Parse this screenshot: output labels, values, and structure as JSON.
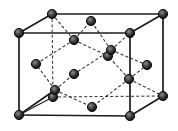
{
  "diagram": {
    "kind": "crystal-structure-unit-cell",
    "canvas": {
      "width": 178,
      "height": 131,
      "background": "#ffffff"
    },
    "style": {
      "edge_color": "#1c1c1c",
      "edge_width": 1.7,
      "hidden_edge_color": "#2e2e2e",
      "hidden_edge_width": 1.0,
      "bond_color": "#2e2e2e",
      "bond_width": 1.05,
      "dash_pattern": "3 2.2",
      "solid_bond_width": 1.6,
      "thin_edge_width": 1.1,
      "atom_radius": 4.6,
      "atom_stroke": "#000000",
      "atom_stroke_width": 0.9,
      "atom_core_color": "#8c8c8c",
      "atom_mid_color": "#343434",
      "atom_rim_color": "#0a0a0a"
    },
    "atoms": [
      {
        "id": "FTL",
        "x": 19,
        "y": 33,
        "kind": "corner"
      },
      {
        "id": "FTR",
        "x": 130,
        "y": 33,
        "kind": "corner"
      },
      {
        "id": "FBL",
        "x": 19,
        "y": 115,
        "kind": "corner"
      },
      {
        "id": "FBR",
        "x": 130,
        "y": 116,
        "kind": "corner"
      },
      {
        "id": "BTL",
        "x": 52,
        "y": 14,
        "kind": "corner"
      },
      {
        "id": "BTR",
        "x": 163,
        "y": 14,
        "kind": "corner"
      },
      {
        "id": "BBL",
        "x": 53,
        "y": 97,
        "kind": "corner"
      },
      {
        "id": "BBR",
        "x": 163,
        "y": 96,
        "kind": "corner"
      },
      {
        "id": "FC-top",
        "x": 91,
        "y": 21,
        "kind": "face-center"
      },
      {
        "id": "FC-bottom",
        "x": 92,
        "y": 107,
        "kind": "face-center"
      },
      {
        "id": "FC-front",
        "x": 74,
        "y": 74,
        "kind": "face-center"
      },
      {
        "id": "FC-back",
        "x": 108,
        "y": 56,
        "kind": "face-center"
      },
      {
        "id": "FC-left",
        "x": 36,
        "y": 64,
        "kind": "face-center"
      },
      {
        "id": "FC-right",
        "x": 147,
        "y": 65,
        "kind": "face-center"
      },
      {
        "id": "T-A",
        "x": 55,
        "y": 90,
        "kind": "interior"
      },
      {
        "id": "T-B",
        "x": 74,
        "y": 40,
        "kind": "interior"
      },
      {
        "id": "T-C",
        "x": 111,
        "y": 50,
        "kind": "interior"
      },
      {
        "id": "T-D",
        "x": 129,
        "y": 79,
        "kind": "interior"
      }
    ],
    "solid_edges": [
      [
        "FTL",
        "FTR"
      ],
      [
        "FTR",
        "FBR"
      ],
      [
        "FBR",
        "FBL"
      ],
      [
        "FBL",
        "FTL"
      ],
      [
        "FTL",
        "BTL"
      ],
      [
        "FTR",
        "BTR"
      ],
      [
        "BTL",
        "BTR"
      ],
      [
        "BTR",
        "BBR"
      ],
      [
        "BBR",
        "FBR"
      ]
    ],
    "thin_solid_edges": [
      [
        "FBL",
        "BBL"
      ]
    ],
    "hidden_edges": [
      [
        "BTL",
        "BBL"
      ],
      [
        "BBL",
        "BBR"
      ]
    ],
    "dashed_bonds": [
      [
        "T-A",
        "FC-left"
      ],
      [
        "T-A",
        "FC-front"
      ],
      [
        "T-A",
        "FC-bottom"
      ],
      [
        "T-B",
        "BTL"
      ],
      [
        "T-B",
        "FC-top"
      ],
      [
        "T-B",
        "FC-back"
      ],
      [
        "T-B",
        "FC-left"
      ],
      [
        "T-C",
        "FTR"
      ],
      [
        "T-C",
        "FC-top"
      ],
      [
        "T-C",
        "FC-front"
      ],
      [
        "T-C",
        "FC-right"
      ],
      [
        "T-D",
        "BBR"
      ],
      [
        "T-D",
        "FC-back"
      ],
      [
        "T-D",
        "FC-bottom"
      ],
      [
        "T-D",
        "FC-right"
      ]
    ],
    "solid_bonds": [
      [
        "FBL",
        "T-A"
      ]
    ]
  }
}
